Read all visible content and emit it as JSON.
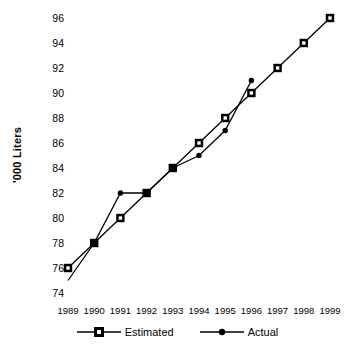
{
  "chart_data": {
    "type": "line",
    "title": "",
    "xlabel": "",
    "ylabel": "'000 Liters",
    "categories": [
      "1989",
      "1990",
      "1991",
      "1992",
      "1993",
      "1994",
      "1995",
      "1996",
      "1997",
      "1998",
      "1999"
    ],
    "ylim": [
      74,
      96
    ],
    "ytick_labels": [
      "74",
      "76",
      "78",
      "80",
      "82",
      "84",
      "86",
      "88",
      "90",
      "92",
      "94",
      "96"
    ],
    "ytick_values": [
      74,
      76,
      78,
      80,
      82,
      84,
      86,
      88,
      90,
      92,
      94,
      96
    ],
    "grid": false,
    "legend_position": "bottom-center",
    "series": [
      {
        "name": "Estimated",
        "marker": "open-square",
        "color": "#000000",
        "x": [
          "1989",
          "1990",
          "1991",
          "1992",
          "1993",
          "1994",
          "1995",
          "1996",
          "1997",
          "1998",
          "1999"
        ],
        "values": [
          76,
          78,
          80,
          82,
          84,
          86,
          88,
          90,
          92,
          94,
          96
        ]
      },
      {
        "name": "Actual",
        "marker": "filled-circle",
        "color": "#000000",
        "x": [
          "1989",
          "1990",
          "1991",
          "1992",
          "1993",
          "1994",
          "1995",
          "1996"
        ],
        "values": [
          75,
          78,
          82,
          82,
          84,
          85,
          87,
          91
        ],
        "first_point_marker_hidden": true
      }
    ]
  },
  "legend": {
    "items": [
      {
        "label": "Estimated"
      },
      {
        "label": "Actual"
      }
    ]
  }
}
